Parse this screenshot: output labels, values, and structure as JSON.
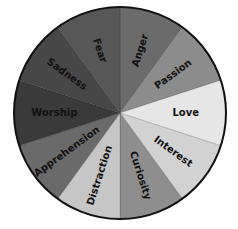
{
  "diagram": {
    "type": "emotion-wheel",
    "center": [
      120,
      113
    ],
    "radius": 106,
    "outline_color": "#111111",
    "start_angle_deg": -90,
    "slices": [
      {
        "label": "Anger",
        "color": "#6b6b6b"
      },
      {
        "label": "Passion",
        "color": "#8c8c8c"
      },
      {
        "label": "Love",
        "color": "#e6e6e6"
      },
      {
        "label": "Interest",
        "color": "#d2d2d2"
      },
      {
        "label": "Curiosity",
        "color": "#8e8e8e"
      },
      {
        "label": "Distraction",
        "color": "#c6c6c6"
      },
      {
        "label": "Apprehension",
        "color": "#6a6a6a"
      },
      {
        "label": "Worship",
        "color": "#3a3a3a"
      },
      {
        "label": "Sadness",
        "color": "#474747"
      },
      {
        "label": "Fear",
        "color": "#575757"
      }
    ]
  }
}
